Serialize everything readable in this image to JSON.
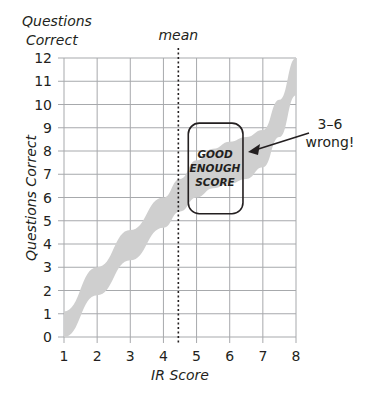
{
  "chart_data": {
    "type": "area",
    "title": "",
    "xlabel": "IR Score",
    "ylabel": "Questions Correct",
    "ylabel_top": [
      "Questions",
      "Correct"
    ],
    "xlim": [
      1,
      8
    ],
    "ylim": [
      0,
      12
    ],
    "x_ticks": [
      "1",
      "2",
      "3",
      "4",
      "5",
      "6",
      "7",
      "8"
    ],
    "y_ticks": [
      "0",
      "1",
      "2",
      "3",
      "4",
      "5",
      "6",
      "7",
      "8",
      "9",
      "10",
      "11",
      "12"
    ],
    "grid": true,
    "band": {
      "x": [
        1,
        2,
        3,
        4,
        4.5,
        5,
        5.5,
        6,
        6.5,
        7,
        7.5,
        8
      ],
      "upper": [
        1.1,
        3.0,
        4.6,
        6.0,
        6.8,
        7.6,
        8.1,
        8.4,
        8.6,
        8.9,
        10.2,
        12.0
      ],
      "lower": [
        0.0,
        1.8,
        3.3,
        4.7,
        5.4,
        6.0,
        6.4,
        6.6,
        6.8,
        7.3,
        8.6,
        10.4
      ],
      "color": "#cfcfcf"
    },
    "mean_line": {
      "x": 4.45,
      "label": "mean",
      "style": "dotted"
    },
    "annotations": [
      {
        "type": "box",
        "text": [
          "GOOD",
          "ENOUGH",
          "SCORE"
        ],
        "x_range": [
          4.75,
          6.4
        ],
        "y_range": [
          5.3,
          9.2
        ]
      },
      {
        "type": "arrow",
        "text": [
          "3–6",
          "wrong!"
        ],
        "target": [
          6.4,
          7.7
        ]
      }
    ]
  }
}
